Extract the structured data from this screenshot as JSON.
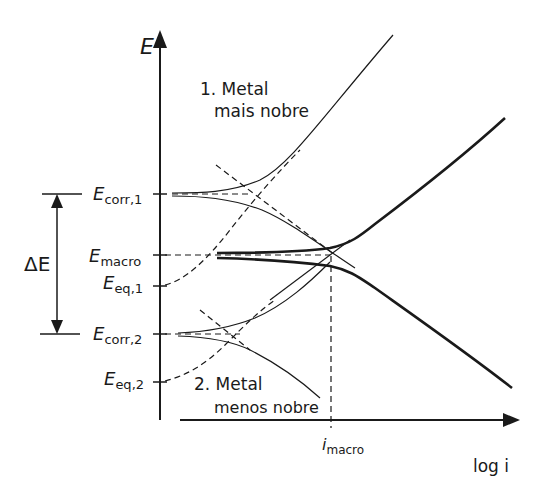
{
  "axes": {
    "y_label": "E",
    "x_label": "log i"
  },
  "levels": {
    "e_corr_1": {
      "main": "E",
      "sub": "corr,1"
    },
    "e_macro": {
      "main": "E",
      "sub": "macro"
    },
    "e_eq_1": {
      "main": "E",
      "sub": "eq,1"
    },
    "e_corr_2": {
      "main": "E",
      "sub": "corr,2"
    },
    "e_eq_2": {
      "main": "E",
      "sub": "eq,2"
    }
  },
  "delta_e": {
    "label": "ΔE"
  },
  "i_macro": {
    "main": "i",
    "sub": "macro"
  },
  "metals": [
    {
      "line1": "1. Metal",
      "line2": "mais nobre"
    },
    {
      "line1": "2. Metal",
      "line2": "menos nobre"
    }
  ],
  "colors": {
    "ink": "#1a1a1a",
    "background": "#ffffff"
  }
}
